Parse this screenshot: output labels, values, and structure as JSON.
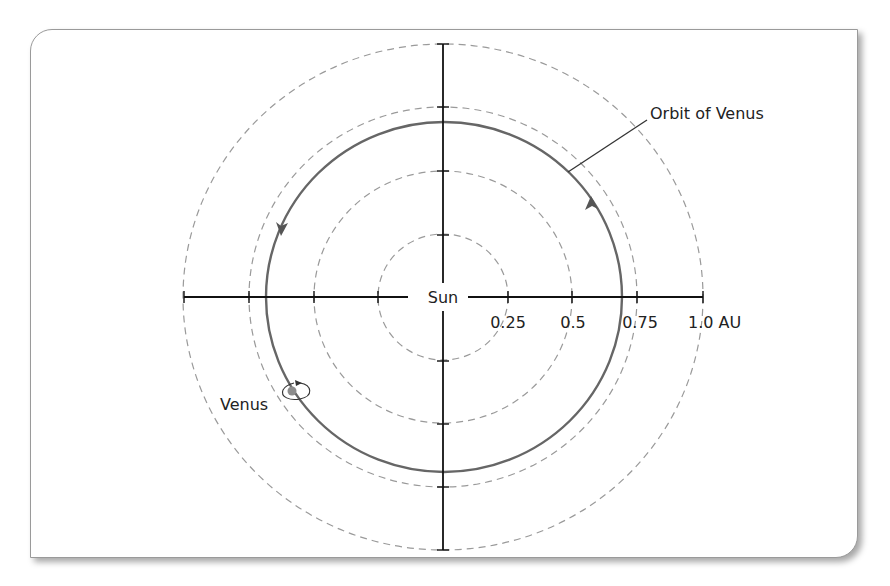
{
  "diagram": {
    "title": "",
    "center_label": "Sun",
    "orbit_label": "Orbit of Venus",
    "planet_label": "Venus",
    "axis_ticks": [
      {
        "value": 0.25,
        "label": "0.25"
      },
      {
        "value": 0.5,
        "label": "0.5"
      },
      {
        "value": 0.75,
        "label": "0.75"
      },
      {
        "value": 1.0,
        "label": "1.0 AU"
      }
    ],
    "orbit_radius_au": 0.72,
    "direction": "counter-clockwise",
    "icons": {
      "planet": "venus-dot-icon",
      "rotation": "rotation-arrow-icon",
      "orbit_direction": "arrowhead-icon"
    },
    "colors": {
      "axis": "#111111",
      "orbit": "#666666",
      "dashed_rings": "#9a9a9a",
      "text": "#222222",
      "frame_border": "#9a9a9a"
    }
  }
}
